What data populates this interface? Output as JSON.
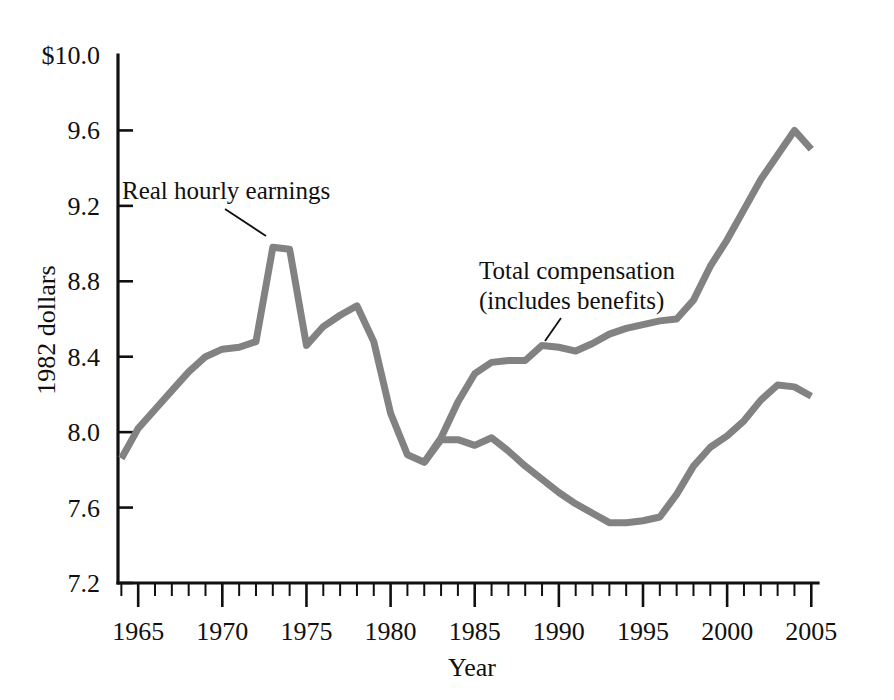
{
  "chart_data": {
    "type": "line",
    "title": "",
    "subtitle": "",
    "xlabel": "Year",
    "ylabel": "1982 dollars",
    "xlim": [
      1963.8,
      2005.4
    ],
    "ylim": [
      7.2,
      10.0
    ],
    "grid": false,
    "legend_position": "inline-annotations",
    "y_ticks": [
      {
        "value": 10.0,
        "label": "$10.0"
      },
      {
        "value": 9.6,
        "label": "9.6"
      },
      {
        "value": 9.2,
        "label": "9.2"
      },
      {
        "value": 8.8,
        "label": "8.8"
      },
      {
        "value": 8.4,
        "label": "8.4"
      },
      {
        "value": 8.0,
        "label": "8.0"
      },
      {
        "value": 7.6,
        "label": "7.6"
      },
      {
        "value": 7.2,
        "label": "7.2"
      }
    ],
    "x_ticks_major": [
      {
        "value": 1965,
        "label": "1965"
      },
      {
        "value": 1970,
        "label": "1970"
      },
      {
        "value": 1975,
        "label": "1975"
      },
      {
        "value": 1980,
        "label": "1980"
      },
      {
        "value": 1985,
        "label": "1985"
      },
      {
        "value": 1990,
        "label": "1990"
      },
      {
        "value": 1995,
        "label": "1995"
      },
      {
        "value": 2000,
        "label": "2000"
      },
      {
        "value": 2005,
        "label": "2005"
      }
    ],
    "x_minor_tick_step": 1,
    "series": [
      {
        "name": "Total compensation (includes benefits)",
        "color": "#828282",
        "x": [
          1964,
          1965,
          1966,
          1967,
          1968,
          1969,
          1970,
          1971,
          1972,
          1973,
          1974,
          1975,
          1976,
          1977,
          1978,
          1979,
          1980,
          1981,
          1982,
          1983,
          1984,
          1985,
          1986,
          1987,
          1988,
          1989,
          1990,
          1991,
          1992,
          1993,
          1994,
          1995,
          1996,
          1997,
          1998,
          1999,
          2000,
          2001,
          2002,
          2003,
          2004,
          2005
        ],
        "values": [
          7.86,
          8.02,
          8.12,
          8.22,
          8.32,
          8.4,
          8.44,
          8.45,
          8.48,
          8.98,
          8.97,
          8.46,
          8.56,
          8.62,
          8.67,
          8.48,
          8.1,
          7.88,
          7.84,
          7.97,
          8.16,
          8.31,
          8.37,
          8.38,
          8.38,
          8.46,
          8.45,
          8.43,
          8.47,
          8.52,
          8.55,
          8.57,
          8.59,
          8.6,
          8.7,
          8.88,
          9.02,
          9.18,
          9.34,
          9.47,
          9.6,
          9.5
        ]
      },
      {
        "name": "Real hourly earnings",
        "color": "#828282",
        "x": [
          1982,
          1983,
          1984,
          1985,
          1986,
          1987,
          1988,
          1989,
          1990,
          1991,
          1992,
          1993,
          1994,
          1995,
          1996,
          1997,
          1998,
          1999,
          2000,
          2001,
          2002,
          2003,
          2004,
          2005
        ],
        "values": [
          7.84,
          7.96,
          7.96,
          7.93,
          7.97,
          7.9,
          7.82,
          7.75,
          7.68,
          7.62,
          7.57,
          7.52,
          7.52,
          7.53,
          7.55,
          7.67,
          7.82,
          7.92,
          7.98,
          8.06,
          8.17,
          8.25,
          8.24,
          8.19
        ]
      }
    ],
    "annotations": [
      {
        "id": "real-hourly-earnings",
        "text_lines": [
          "Real hourly earnings"
        ],
        "text_x": 122,
        "text_y": 199,
        "leader": {
          "x1": 225,
          "y1": 209,
          "x2": 266,
          "y2": 236
        }
      },
      {
        "id": "total-compensation",
        "text_lines": [
          "Total compensation",
          "(includes benefits)"
        ],
        "text_x": 479,
        "text_y": 279,
        "leader": {
          "x1": 561,
          "y1": 318,
          "x2": 545,
          "y2": 341
        }
      }
    ]
  },
  "colors": {
    "line": "#828282",
    "axis": "#101010",
    "background": "#ffffff"
  }
}
